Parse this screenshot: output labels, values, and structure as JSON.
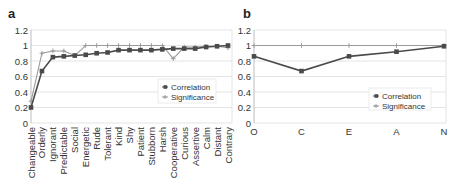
{
  "colors": {
    "correlation": "#4a4a4a",
    "significance": "#9a9a9a",
    "grid": "#e4e4e4",
    "axis": "#bdbdbd"
  },
  "chart_data": [
    {
      "panel": "a",
      "type": "line",
      "title": "",
      "xlabel": "",
      "ylabel": "",
      "ylim": [
        0,
        1.2
      ],
      "yticks": [
        "0",
        "0.2",
        "0.4",
        "0.6",
        "0.8",
        "1",
        "1.2"
      ],
      "grid": true,
      "legend_position": "inside-right-middle",
      "categories": [
        "Changeable",
        "Orderly",
        "Ignorant",
        "Predictable",
        "Social",
        "Energetic",
        "Rude",
        "Tolerant",
        "Kind",
        "Shy",
        "Patient",
        "Stubborn",
        "Harsh",
        "Cooperative",
        "Curious",
        "Assertive",
        "Calm",
        "Distant",
        "Contrary"
      ],
      "series": [
        {
          "name": "Correlation",
          "marker": "square",
          "values": [
            0.2,
            0.67,
            0.85,
            0.86,
            0.87,
            0.88,
            0.9,
            0.91,
            0.94,
            0.94,
            0.94,
            0.94,
            0.95,
            0.96,
            0.96,
            0.96,
            0.98,
            0.99,
            1.0
          ]
        },
        {
          "name": "Significance",
          "marker": "plus",
          "values": [
            0.28,
            0.9,
            0.93,
            0.93,
            0.87,
            1.0,
            1.0,
            1.0,
            1.0,
            1.0,
            1.0,
            1.0,
            1.0,
            0.83,
            0.98,
            0.98,
            0.99,
            0.99,
            0.97
          ]
        }
      ]
    },
    {
      "panel": "b",
      "type": "line",
      "title": "",
      "xlabel": "",
      "ylabel": "",
      "ylim": [
        0,
        1.2
      ],
      "yticks": [
        "0",
        "0.2",
        "0.4",
        "0.6",
        "0.8",
        "1",
        "1.2"
      ],
      "grid": true,
      "legend_position": "inside-right-bottom",
      "categories": [
        "O",
        "C",
        "E",
        "A",
        "N"
      ],
      "series": [
        {
          "name": "Correlation",
          "marker": "square",
          "values": [
            0.86,
            0.67,
            0.86,
            0.92,
            0.99
          ]
        },
        {
          "name": "Significance",
          "marker": "plus",
          "values": [
            1.0,
            1.0,
            1.0,
            1.0,
            1.0
          ]
        }
      ]
    }
  ]
}
